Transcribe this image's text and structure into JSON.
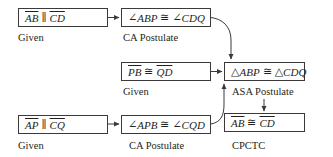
{
  "diagram": {
    "type": "flowchart-proof",
    "steps": [
      {
        "id": "s1",
        "statement": {
          "seg1": "AB",
          "rel": "∥",
          "seg2": "CD"
        },
        "reason": "Given"
      },
      {
        "id": "s2",
        "statement": {
          "ang_sym": "∠",
          "ang1": "ABP",
          "rel": "≅",
          "ang_sym2": "∠",
          "ang2": "CDQ"
        },
        "reason": "CA Postulate"
      },
      {
        "id": "s3",
        "statement": {
          "seg1": "PB",
          "rel": "≅",
          "seg2": "QD"
        },
        "reason": "Given"
      },
      {
        "id": "s4",
        "statement": {
          "tri_sym": "△",
          "tri1": "ABP",
          "rel": "≅",
          "tri_sym2": "△",
          "tri2": "CDQ"
        },
        "reason": "ASA Postulate"
      },
      {
        "id": "s5",
        "statement": {
          "seg1": "AP",
          "rel": "∥",
          "seg2": "CQ"
        },
        "reason": "Given"
      },
      {
        "id": "s6",
        "statement": {
          "ang_sym": "∠",
          "ang1": "APB",
          "rel": "≅",
          "ang_sym2": "∠",
          "ang2": "CQD"
        },
        "reason": "CA Postulate"
      },
      {
        "id": "s7",
        "statement": {
          "seg1": "AB",
          "rel": "≅",
          "seg2": "CD"
        },
        "reason": "CPCTC"
      }
    ],
    "edges": [
      {
        "from": "s1",
        "to": "s2"
      },
      {
        "from": "s2",
        "to": "s4"
      },
      {
        "from": "s3",
        "to": "s4"
      },
      {
        "from": "s5",
        "to": "s6"
      },
      {
        "from": "s6",
        "to": "s4"
      },
      {
        "from": "s4",
        "to": "s7"
      }
    ],
    "colors": {
      "stroke": "#3a3a3a",
      "text": "#231f20",
      "background": "#ffffff"
    }
  }
}
